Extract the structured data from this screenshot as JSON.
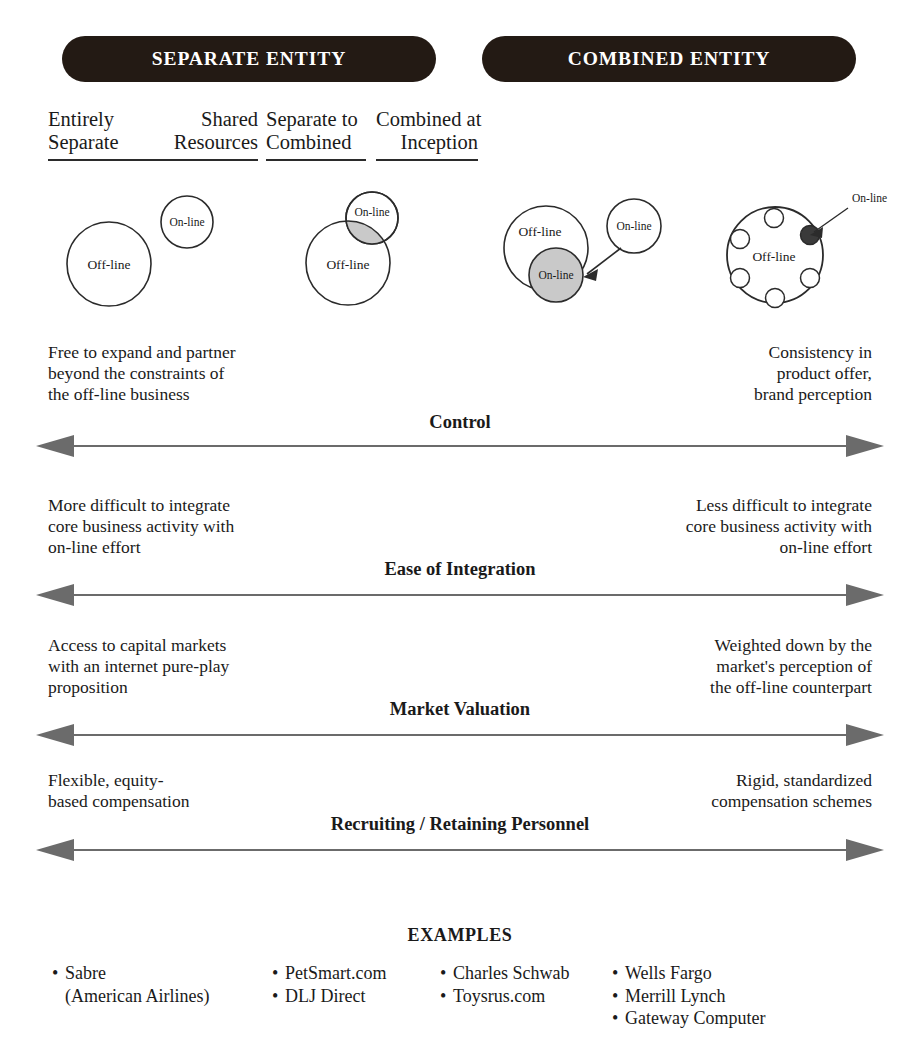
{
  "headers": [
    {
      "label": "SEPARATE ENTITY"
    },
    {
      "label": "COMBINED ENTITY"
    }
  ],
  "columns": [
    {
      "line1": "Entirely",
      "line2": "Separate"
    },
    {
      "line1": "Shared",
      "line2": "Resources"
    },
    {
      "line1": "Separate to",
      "line2": "Combined"
    },
    {
      "line1": "Combined at",
      "line2": "Inception"
    }
  ],
  "diagram_labels": {
    "offline": "Off-line",
    "online": "On-line"
  },
  "spectrums": [
    {
      "axis": "Control",
      "left": "Free to expand and partner\nbeyond the constraints of\nthe off-line business",
      "left_lines": [
        "Free to expand and partner",
        "beyond the constraints of",
        "the off-line business"
      ],
      "right_lines": [
        "Consistency in",
        "product offer,",
        "brand perception"
      ]
    },
    {
      "axis": "Ease of Integration",
      "left_lines": [
        "More difficult to integrate",
        "core business activity with",
        "on-line effort"
      ],
      "right_lines": [
        "Less difficult to integrate",
        "core business activity with",
        "on-line effort"
      ]
    },
    {
      "axis": "Market Valuation",
      "left_lines": [
        "Access to capital markets",
        "with an internet pure-play",
        "proposition"
      ],
      "right_lines": [
        "Weighted down by the",
        "market's perception of",
        "the off-line counterpart"
      ]
    },
    {
      "axis": "Recruiting / Retaining Personnel",
      "left_lines": [
        "Flexible, equity-",
        "based compensation"
      ],
      "right_lines": [
        "Rigid, standardized",
        "compensation schemes"
      ]
    }
  ],
  "examples": {
    "title": "EXAMPLES",
    "groups": [
      {
        "items": [
          "Sabre"
        ],
        "subitems": [
          "(American Airlines)"
        ]
      },
      {
        "items": [
          "PetSmart.com",
          "DLJ Direct"
        ],
        "subitems": []
      },
      {
        "items": [
          "Charles Schwab",
          "Toysrus.com"
        ],
        "subitems": []
      },
      {
        "items": [
          "Wells Fargo",
          "Merrill Lynch",
          "Gateway Computer"
        ],
        "subitems": []
      }
    ]
  },
  "colors": {
    "pill_bg": "#231a14",
    "pill_text": "#ffffff",
    "ink": "#1a1a1a",
    "arrow": "#6b6b6b",
    "shade": "#c9c9c9"
  }
}
